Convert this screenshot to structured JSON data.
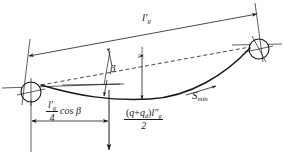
{
  "figure": {
    "kind": "engineering-diagram",
    "background_color": "#ffffff",
    "line_color": "#1a1a1a",
    "text_color": "#1a1a1a"
  },
  "labels": {
    "span_length": {
      "text": "l′g",
      "base": "l",
      "prime": "′",
      "subscript": "g",
      "meaning": "inclined span length dimension along top dimension line"
    },
    "beta": {
      "text": "β",
      "meaning": "inclination angle between horizontal reference and chord"
    },
    "y_max": {
      "text": "ymax",
      "base": "y",
      "subscript": "max",
      "meaning": "maximum sag measured vertically from chord to curve",
      "rotated": "-90deg"
    },
    "s_min": {
      "text": "Smin",
      "base": "S",
      "subscript": "min",
      "meaning": "minimum tension point along the curve"
    },
    "quarter_span": {
      "numerator": "l′g",
      "numerator_base": "l",
      "numerator_prime": "′",
      "numerator_subscript": "g",
      "denominator": "4",
      "trailing": "cos β",
      "meaning": "horizontal distance equal to one quarter span times cosine beta"
    },
    "load_resultant": {
      "numerator": "(q+qd)l″g",
      "numerator_parts": {
        "open": "(",
        "q": "q",
        "plus": "+",
        "qd_base": "q",
        "qd_sub": "d",
        "close": ")",
        "l_base": "l",
        "l_prime": "″",
        "l_sub": "g"
      },
      "denominator": "2",
      "meaning": "resultant distributed load over half the span"
    }
  },
  "geometry": {
    "pulley_left": {
      "cx": 31,
      "cy": 92,
      "r": 10
    },
    "pulley_right": {
      "cx": 259,
      "cy": 49,
      "r": 10
    },
    "chord": {
      "x1": 41,
      "y1": 85,
      "x2": 250,
      "y2": 48,
      "style": "dashed"
    },
    "sag_curve": {
      "from_x": 41,
      "from_y": 85,
      "min_x": 150,
      "min_y": 99,
      "to_x": 250,
      "to_y": 48
    },
    "dimension_top": {
      "x1": 30,
      "y1": 55,
      "x2": 258,
      "y2": 13,
      "arrows": "both"
    },
    "dimension_bottom": {
      "x1": 31,
      "y1": 121,
      "x2": 109,
      "y2": 121,
      "arrows": "both"
    },
    "load_arrow": {
      "x": 109,
      "y1": 90,
      "y2": 148,
      "arrow": "down"
    }
  }
}
